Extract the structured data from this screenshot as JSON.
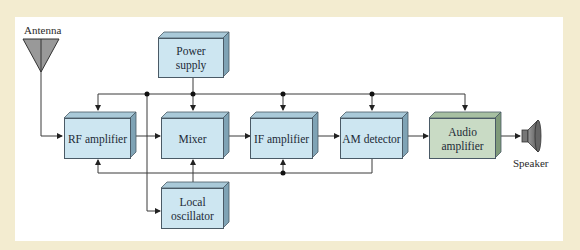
{
  "diagram": {
    "colors": {
      "background": "#f3ecd0",
      "panel": "#ffffff",
      "block_blue": "#cde6f1",
      "block_green": "#c9dbc5",
      "line": "#3a3a3a"
    },
    "antenna": {
      "label": "Antenna",
      "icon": "antenna-icon"
    },
    "speaker": {
      "label": "Speaker",
      "icon": "speaker-icon"
    },
    "blocks": {
      "power_supply": "Power supply",
      "rf_amplifier": "RF amplifier",
      "mixer": "Mixer",
      "if_amplifier": "IF amplifier",
      "am_detector": "AM detector",
      "audio_amplifier": "Audio amplifier",
      "local_oscillator": "Local oscillator"
    },
    "connections": [
      [
        "Antenna",
        "RF amplifier"
      ],
      [
        "RF amplifier",
        "Mixer"
      ],
      [
        "Local oscillator",
        "Mixer"
      ],
      [
        "Mixer",
        "IF amplifier"
      ],
      [
        "IF amplifier",
        "AM detector"
      ],
      [
        "AM detector",
        "Audio amplifier"
      ],
      [
        "Audio amplifier",
        "Speaker"
      ],
      [
        "Power supply",
        "RF amplifier, Mixer, IF amplifier, AM detector, Audio amplifier, Local oscillator"
      ],
      [
        "AM detector",
        "RF amplifier, IF amplifier (AGC feedback)"
      ]
    ]
  }
}
